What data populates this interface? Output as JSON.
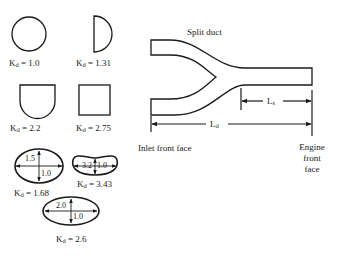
{
  "figure": {
    "cross_sections": [
      {
        "id": "circle",
        "shape": "circle",
        "label_prefix": "K",
        "label_sub": "d",
        "label_value": " = 1.0"
      },
      {
        "id": "half-circle",
        "shape": "half-circle",
        "label_prefix": "K",
        "label_sub": "d",
        "label_value": " = 1.31"
      },
      {
        "id": "d-shape",
        "shape": "u-shape",
        "label_prefix": "K",
        "label_sub": "d",
        "label_value": " = 2.2"
      },
      {
        "id": "square",
        "shape": "square",
        "label_prefix": "K",
        "label_sub": "d",
        "label_value": " = 2.75"
      },
      {
        "id": "ellipse-1",
        "shape": "ellipse",
        "label_prefix": "K",
        "label_sub": "d",
        "label_value": " = 1.68",
        "major_dim": "1.5",
        "minor_dim": "1.0"
      },
      {
        "id": "kidney",
        "shape": "kidney",
        "label_prefix": "K",
        "label_sub": "d",
        "label_value": " = 3.43",
        "major_dim": "3.2",
        "minor_dim": "1.0"
      },
      {
        "id": "ellipse-2",
        "shape": "ellipse",
        "label_prefix": "K",
        "label_sub": "d",
        "label_value": " = 2.6",
        "major_dim": "2.0",
        "minor_dim": "1.0"
      }
    ],
    "duct": {
      "title": "Split duct",
      "ls_prefix": "L",
      "ls_sub": "s",
      "ld_prefix": "L",
      "ld_sub": "d",
      "inlet_label": "Inlet front face",
      "engine_label_line1": "Engine",
      "engine_label_line2": "front",
      "engine_label_line3": "face"
    },
    "colors": {
      "stroke": "#1a1a1a",
      "background": "#ffffff"
    }
  }
}
